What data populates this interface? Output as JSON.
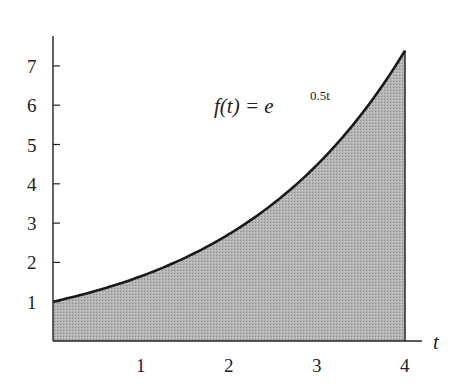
{
  "chart_data": {
    "type": "area",
    "title": "",
    "function": "f(t) = e^(0.5t)",
    "annotation": {
      "prefix": "f(t) = e",
      "exponent": "0.5t"
    },
    "xlabel": "t",
    "ylabel": "",
    "xlim": [
      0,
      4
    ],
    "ylim": [
      0,
      7.8
    ],
    "x_ticks": [
      "1",
      "2",
      "3",
      "4"
    ],
    "y_ticks": [
      "1",
      "2",
      "3",
      "4",
      "5",
      "6",
      "7"
    ],
    "x": [
      0,
      0.5,
      1,
      1.5,
      2,
      2.5,
      3,
      3.5,
      4
    ],
    "values": [
      1.0,
      1.284,
      1.649,
      2.117,
      2.718,
      3.49,
      4.482,
      5.755,
      7.389
    ],
    "shaded_region": {
      "from": 0,
      "to": 4,
      "fill": "#b0b0b0"
    },
    "grid": false,
    "legend": null
  }
}
